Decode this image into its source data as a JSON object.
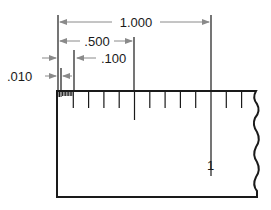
{
  "diagram": {
    "units": "inch",
    "dimensions": [
      {
        "id": "one",
        "label": "1.000",
        "value": 1.0
      },
      {
        "id": "half",
        "label": ".500",
        "value": 0.5
      },
      {
        "id": "tenth",
        "label": ".100",
        "value": 0.1
      },
      {
        "id": "hundredth",
        "label": ".010",
        "value": 0.01
      }
    ],
    "scale": {
      "major_label": "1",
      "tenth_divisions_shown": 12,
      "hundredth_divisions_in_first_tenth": 10
    },
    "colors": {
      "line": "#1a1a1a",
      "dimension_line": "#8a8a8a",
      "background": "#ffffff"
    }
  }
}
